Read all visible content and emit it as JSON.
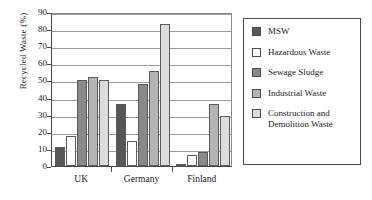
{
  "chart_data": {
    "type": "bar",
    "title": "",
    "xlabel": "",
    "ylabel": "Recycled Waste (%)",
    "categories": [
      "UK",
      "Germany",
      "Finland"
    ],
    "ylim": [
      0,
      90
    ],
    "yticks": [
      0,
      10,
      20,
      30,
      40,
      50,
      60,
      70,
      80,
      90
    ],
    "grid": true,
    "legend_position": "right",
    "series": [
      {
        "name": "MSW",
        "color": "#575757",
        "values": [
          11,
          36,
          1
        ]
      },
      {
        "name": "Hazardous Waste",
        "color": "#ffffff",
        "values": [
          17.5,
          14.5,
          6.5
        ]
      },
      {
        "name": "Sewage Sludge",
        "color": "#898989",
        "values": [
          50,
          48,
          8
        ]
      },
      {
        "name": "Industrial Waste",
        "color": "#b4b4b4",
        "values": [
          52,
          55.5,
          36.5
        ]
      },
      {
        "name": "Construction and Demolition Waste",
        "color": "#dcdcdc",
        "values": [
          50,
          83,
          29
        ]
      }
    ]
  },
  "legend": {
    "items": [
      {
        "label": "MSW"
      },
      {
        "label": "Hazardous Waste"
      },
      {
        "label": "Sewage Sludge"
      },
      {
        "label": "Industrial Waste"
      },
      {
        "label": "Construction and Demolition Waste"
      }
    ]
  }
}
